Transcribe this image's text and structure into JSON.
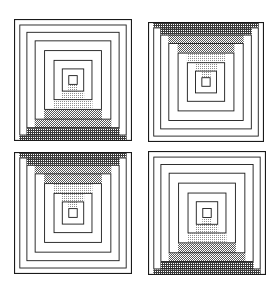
{
  "figure": {
    "background_color": "#ffffff",
    "line_color": "#1a1a1a",
    "shade_colors": {
      "light": "#d8d8d8",
      "medium": "#b4b4b4",
      "dark": "#8c8c8c",
      "darkest": "#5a5a5a"
    },
    "grid": {
      "rows": 2,
      "columns": 2,
      "panel_count": 4
    }
  },
  "panels": [
    {
      "id": "panel-top-left",
      "position": "top-left",
      "x": 14,
      "y": 19,
      "width": 118,
      "height": 122,
      "shading_side": "bottom",
      "center_fill": "empty",
      "ring_count": 9,
      "center_label": "empty-center-square"
    },
    {
      "id": "panel-top-right",
      "position": "top-right",
      "x": 148,
      "y": 22,
      "width": 116,
      "height": 120,
      "shading_side": "top",
      "center_fill": "dithered",
      "ring_count": 9,
      "center_label": "filled-center-square"
    },
    {
      "id": "panel-bottom-left",
      "position": "bottom-left",
      "x": 14,
      "y": 152,
      "width": 118,
      "height": 122,
      "shading_side": "top",
      "center_fill": "dithered",
      "ring_count": 9,
      "center_label": "filled-center-square"
    },
    {
      "id": "panel-bottom-right",
      "position": "bottom-right",
      "x": 148,
      "y": 151,
      "width": 118,
      "height": 124,
      "shading_side": "bottom",
      "center_fill": "empty",
      "ring_count": 9,
      "center_label": "empty-center-square"
    }
  ],
  "rings": {
    "comment": "Inset fraction of each concentric square from the panel edge, outermost first",
    "insets": [
      0.0,
      0.045,
      0.105,
      0.175,
      0.255,
      0.335,
      0.405,
      0.46,
      0.5
    ],
    "shade_tones": [
      "darkest",
      "dark",
      "dark",
      "medium",
      "medium",
      "light",
      "light",
      "light",
      "light"
    ]
  }
}
